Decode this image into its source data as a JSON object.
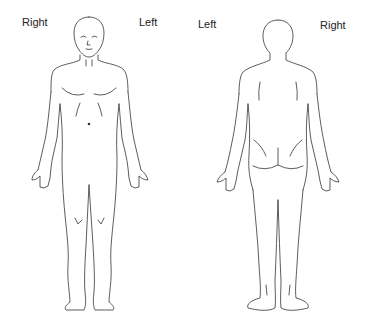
{
  "figure": {
    "type": "body-diagram",
    "views": [
      {
        "name": "front",
        "left_label": "Right",
        "right_label": "Left"
      },
      {
        "name": "back",
        "left_label": "Left",
        "right_label": "Right"
      }
    ]
  },
  "colors": {
    "line": "#333333",
    "background": "#ffffff",
    "text": "#222222"
  }
}
